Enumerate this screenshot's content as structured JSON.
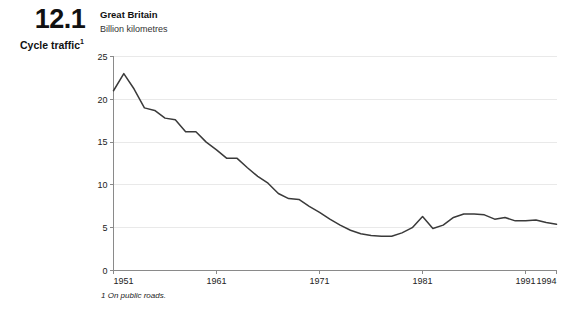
{
  "figure": {
    "number": "12.1",
    "caption": "Cycle traffic",
    "caption_superscript": "1"
  },
  "header": {
    "region_title": "Great Britain",
    "unit_subtitle": "Billion kilometres"
  },
  "footnote": {
    "text": "1 On public roads."
  },
  "colors": {
    "series_line": "#3a3a3a",
    "axis": "#8a8a8a",
    "grid": "#e9e9e9",
    "background": "#ffffff",
    "text": "#1a1a1a"
  },
  "chart_data": {
    "type": "line",
    "title": "Great Britain",
    "subtitle": "Billion kilometres",
    "xlabel": "",
    "ylabel": "Billion kilometres",
    "xlim": [
      1951,
      1994
    ],
    "ylim": [
      0,
      25
    ],
    "yticks": [
      0,
      5,
      10,
      15,
      20,
      25
    ],
    "ytick_labels": [
      "0",
      "5",
      "10",
      "15",
      "20",
      "25"
    ],
    "xticks": [
      1951,
      1961,
      1971,
      1981,
      1991,
      1994
    ],
    "xtick_labels": [
      "1951",
      "1961",
      "1971",
      "1981",
      "1991",
      "1994"
    ],
    "grid": "horizontal",
    "legend": "none",
    "series": [
      {
        "name": "Cycle traffic",
        "color": "#3a3a3a",
        "x": [
          1951,
          1952,
          1953,
          1954,
          1955,
          1956,
          1957,
          1958,
          1959,
          1960,
          1961,
          1962,
          1963,
          1964,
          1965,
          1966,
          1967,
          1968,
          1969,
          1970,
          1971,
          1972,
          1973,
          1974,
          1975,
          1976,
          1977,
          1978,
          1979,
          1980,
          1981,
          1982,
          1983,
          1984,
          1985,
          1986,
          1987,
          1988,
          1989,
          1990,
          1991,
          1992,
          1993,
          1994
        ],
        "values": [
          21.0,
          23.0,
          21.2,
          19.0,
          18.7,
          17.8,
          17.6,
          16.2,
          16.2,
          15.0,
          14.1,
          13.1,
          13.1,
          12.0,
          11.0,
          10.2,
          9.0,
          8.4,
          8.3,
          7.5,
          6.8,
          6.0,
          5.3,
          4.7,
          4.3,
          4.1,
          4.0,
          4.0,
          4.4,
          5.0,
          6.3,
          4.9,
          5.3,
          6.2,
          6.6,
          6.6,
          6.5,
          6.0,
          6.2,
          5.8,
          5.8,
          5.9,
          5.6,
          5.4
        ]
      }
    ]
  }
}
